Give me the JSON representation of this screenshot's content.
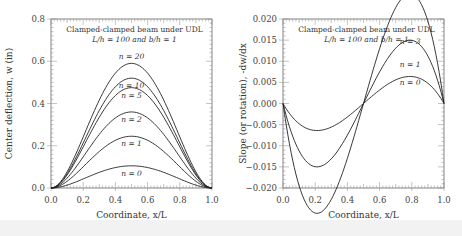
{
  "chart_data": [
    {
      "type": "line",
      "title": "Clamped-clamped beam under UDL",
      "subtitle": "L/h = 100 and b/h = 1",
      "xlabel": "Coordinate, x/L",
      "ylabel": "Center deflection, w (in)",
      "xlim": [
        0.0,
        1.0
      ],
      "ylim": [
        0.0,
        0.8
      ],
      "xticks": [
        "0.0",
        "0.2",
        "0.4",
        "0.6",
        "0.8",
        "1.0"
      ],
      "yticks": [
        "0.0",
        "0.2",
        "0.4",
        "0.6",
        "0.8"
      ],
      "grid": false,
      "series": [
        {
          "name": "n = 20",
          "peak_x": 0.5,
          "peak": 0.59
        },
        {
          "name": "n = 10",
          "peak_x": 0.5,
          "peak": 0.52
        },
        {
          "name": "n = 5",
          "peak_x": 0.5,
          "peak": 0.475
        },
        {
          "name": "n = 2",
          "peak_x": 0.5,
          "peak": 0.36
        },
        {
          "name": "n = 1",
          "peak_x": 0.5,
          "peak": 0.245
        },
        {
          "name": "n = 0",
          "peak_x": 0.5,
          "peak": 0.105
        }
      ],
      "shape": "w(x) = 16*peak*(x^2)*(1-x)^2"
    },
    {
      "type": "line",
      "title": "Clamped-clamped beam under UDL",
      "subtitle": "L/h = 100 and b/h = 1",
      "xlabel": "Coordinate, x/L",
      "ylabel": "Slope (or rotation), -dw/dx",
      "xlim": [
        0.0,
        1.0
      ],
      "ylim": [
        -0.02,
        0.02
      ],
      "xticks": [
        "0.0",
        "0.2",
        "0.4",
        "0.6",
        "0.8",
        "1.0"
      ],
      "yticks": [
        "0.020",
        "0.015",
        "0.010",
        "0.005",
        "0.000",
        "-0.005",
        "-0.010",
        "-0.015",
        "-0.020"
      ],
      "grid": false,
      "series": [
        {
          "name": "n = 3",
          "min_x": 0.21,
          "min": -0.013,
          "max_x": 0.79,
          "max": 0.013
        },
        {
          "name": "n = 1",
          "min_x": 0.21,
          "min": -0.0075,
          "max_x": 0.79,
          "max": 0.0075
        },
        {
          "name": "n = 0",
          "min_x": 0.21,
          "min": -0.0032,
          "max_x": 0.79,
          "max": 0.0032
        }
      ],
      "shape": "theta(x) proportional to x(1-x)(2x-1)"
    }
  ]
}
